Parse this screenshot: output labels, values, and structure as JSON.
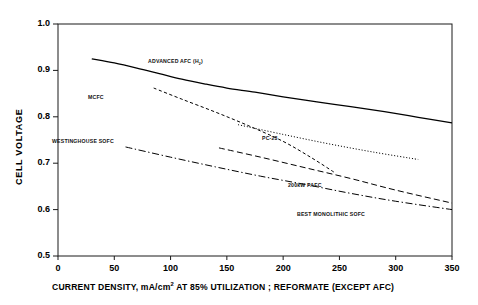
{
  "chart_data": {
    "type": "line",
    "title": "",
    "xlabel_parts": {
      "pre": "CURRENT DENSITY, mA/cm",
      "sup": "2",
      "post": "  AT 85% UTILIZATION ; REFORMATE (EXCEPT AFC)"
    },
    "xlabel": "CURRENT DENSITY, mA/cm2  AT 85% UTILIZATION ; REFORMATE (EXCEPT AFC)",
    "ylabel": "CELL VOLTAGE",
    "xlim": [
      0,
      350
    ],
    "ylim": [
      0.5,
      1.0
    ],
    "xticks": [
      "0",
      "50",
      "100",
      "150",
      "200",
      "250",
      "300",
      "350"
    ],
    "xtick_values": [
      0,
      50,
      100,
      150,
      200,
      250,
      300,
      350
    ],
    "yticks": [
      "0.5",
      "0.6",
      "0.7",
      "0.8",
      "0.9",
      "1.0"
    ],
    "ytick_values": [
      0.5,
      0.6,
      0.7,
      0.8,
      0.9,
      1.0
    ],
    "grid": false,
    "legend": "inline-annotations",
    "series": [
      {
        "name": "ADVANCED AFC (H2)",
        "label_parts": {
          "pre": "ADVANCED AFC (H",
          "sub": "2",
          "post": ")"
        },
        "style": "solid",
        "color": "#000000",
        "label_x": 148,
        "label_y": 241,
        "points": [
          [
            30,
            0.925
          ],
          [
            50,
            0.916
          ],
          [
            70,
            0.905
          ],
          [
            90,
            0.893
          ],
          [
            110,
            0.881
          ],
          [
            130,
            0.871
          ],
          [
            150,
            0.862
          ],
          [
            175,
            0.853
          ],
          [
            200,
            0.843
          ],
          [
            230,
            0.832
          ],
          [
            260,
            0.822
          ],
          [
            290,
            0.811
          ],
          [
            320,
            0.799
          ],
          [
            350,
            0.787
          ]
        ]
      },
      {
        "name": "MCFC",
        "label_parts": {
          "pre": "MCFC",
          "sub": "",
          "post": ""
        },
        "style": "dashed-fine",
        "color": "#000000",
        "label_x": 88,
        "label_y": 205,
        "points": [
          [
            85,
            0.862
          ],
          [
            110,
            0.838
          ],
          [
            140,
            0.81
          ],
          [
            170,
            0.78
          ],
          [
            200,
            0.747
          ],
          [
            225,
            0.712
          ],
          [
            245,
            0.681
          ]
        ]
      },
      {
        "name": "PC-23",
        "label_parts": {
          "pre": "PC-23",
          "sub": "",
          "post": ""
        },
        "style": "dotted",
        "color": "#000000",
        "label_x": 262,
        "label_y": 164,
        "points": [
          [
            160,
            0.783
          ],
          [
            200,
            0.762
          ],
          [
            240,
            0.742
          ],
          [
            280,
            0.724
          ],
          [
            320,
            0.708
          ]
        ]
      },
      {
        "name": "200kW PAFC",
        "label_parts": {
          "pre": "200kW PAFC",
          "sub": "",
          "post": ""
        },
        "style": "dashed-long",
        "color": "#000000",
        "label_x": 288,
        "label_y": 117,
        "points": [
          [
            143,
            0.733
          ],
          [
            180,
            0.713
          ],
          [
            220,
            0.69
          ],
          [
            260,
            0.667
          ],
          [
            300,
            0.642
          ],
          [
            350,
            0.614
          ]
        ]
      },
      {
        "name": "BEST MONOLITHIC SOFC",
        "label_parts": {
          "pre": "BEST MONOLITHIC SOFC",
          "sub": "",
          "post": ""
        },
        "style": "dash-dot",
        "color": "#000000",
        "label_x": 297,
        "label_y": 88,
        "points": [
          [
            60,
            0.735
          ],
          [
            100,
            0.713
          ],
          [
            140,
            0.692
          ],
          [
            180,
            0.672
          ],
          [
            220,
            0.654
          ],
          [
            260,
            0.635
          ],
          [
            300,
            0.618
          ],
          [
            350,
            0.6
          ]
        ]
      },
      {
        "name": "WESTINGHOUSE SOFC",
        "label_parts": {
          "pre": "WESTINGHOUSE SOFC",
          "sub": "",
          "post": ""
        },
        "style": "annotation-only",
        "color": "#000000",
        "label_x": 52,
        "label_y": 161,
        "points": []
      }
    ]
  }
}
